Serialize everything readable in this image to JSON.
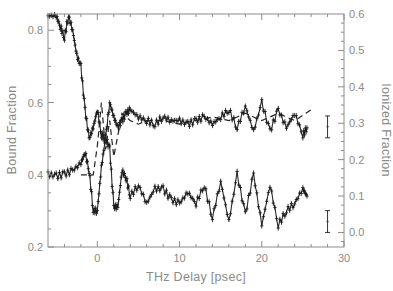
{
  "chart_data": {
    "type": "line",
    "title": "",
    "xlabel": "THz Delay [psec]",
    "ylabel_left": "Bound Fraction",
    "ylabel_right": "Ionized Fraction",
    "xlim": [
      -6,
      30
    ],
    "ylim_left": [
      0.2,
      0.845
    ],
    "ylim_right": [
      -0.04,
      0.6
    ],
    "x_ticks": [
      0,
      10,
      20,
      30
    ],
    "x_tick_labels": [
      "0",
      "10",
      "20",
      "30"
    ],
    "y_left_ticks": [
      0.2,
      0.4,
      0.6,
      0.8
    ],
    "y_left_tick_labels": [
      "0.2",
      "0.4",
      "0.6",
      "0.8"
    ],
    "y_right_ticks": [
      0.0,
      0.1,
      0.2,
      0.3,
      0.4,
      0.5,
      0.6
    ],
    "y_right_tick_labels": [
      "0.0",
      "0.1",
      "0.2",
      "0.3",
      "0.4",
      "0.5",
      "0.6"
    ],
    "grid": false,
    "legend": null,
    "series": [
      {
        "name": "Bound Fraction (measured)",
        "axis": "left",
        "style": "markers-with-line",
        "x": [
          -6,
          -5,
          -4.5,
          -4,
          -3.5,
          -3,
          -2.5,
          -2,
          -1.5,
          -1,
          -0.5,
          0,
          0.5,
          1,
          1.5,
          2,
          2.5,
          3,
          3.5,
          4,
          5,
          6,
          7,
          8,
          9,
          10,
          11,
          12,
          13,
          14,
          15,
          16,
          17,
          18,
          19,
          20,
          21,
          22,
          23,
          24,
          25,
          25.5
        ],
        "y": [
          0.84,
          0.84,
          0.81,
          0.78,
          0.84,
          0.8,
          0.73,
          0.7,
          0.58,
          0.5,
          0.53,
          0.58,
          0.51,
          0.5,
          0.6,
          0.56,
          0.53,
          0.55,
          0.57,
          0.58,
          0.56,
          0.55,
          0.54,
          0.56,
          0.55,
          0.55,
          0.54,
          0.55,
          0.56,
          0.54,
          0.56,
          0.58,
          0.53,
          0.59,
          0.52,
          0.6,
          0.52,
          0.58,
          0.53,
          0.57,
          0.51,
          0.53
        ]
      },
      {
        "name": "Ionized Fraction (measured)",
        "axis": "right",
        "style": "markers-with-line",
        "x": [
          -6,
          -5,
          -4,
          -3,
          -2,
          -1.5,
          -1,
          -0.5,
          0,
          0.5,
          1,
          1.5,
          2,
          2.5,
          3,
          3.5,
          4,
          5,
          6,
          7,
          8,
          9,
          10,
          11,
          12,
          13,
          14,
          15,
          16,
          17,
          18,
          19,
          20,
          21,
          22,
          23,
          24,
          25,
          25.5
        ],
        "y": [
          0.16,
          0.155,
          0.16,
          0.17,
          0.19,
          0.22,
          0.17,
          0.06,
          0.06,
          0.18,
          0.26,
          0.23,
          0.07,
          0.07,
          0.17,
          0.15,
          0.1,
          0.13,
          0.08,
          0.12,
          0.12,
          0.09,
          0.08,
          0.11,
          0.08,
          0.13,
          0.04,
          0.14,
          0.03,
          0.16,
          0.05,
          0.16,
          0.02,
          0.13,
          0.02,
          0.06,
          0.08,
          0.12,
          0.1
        ]
      },
      {
        "name": "Bound Fraction (theory, dashed)",
        "axis": "left",
        "style": "dashed",
        "x": [
          -2,
          -1,
          -0.5,
          0,
          0.5,
          1,
          1.5,
          2,
          3,
          4,
          5,
          6,
          8,
          10,
          12,
          14,
          16,
          18,
          20,
          22,
          24,
          26
        ],
        "y": [
          0.4,
          0.4,
          0.4,
          0.48,
          0.6,
          0.47,
          0.55,
          0.45,
          0.57,
          0.55,
          0.54,
          0.55,
          0.55,
          0.54,
          0.55,
          0.56,
          0.55,
          0.57,
          0.55,
          0.57,
          0.55,
          0.58
        ]
      }
    ],
    "annotations": [
      {
        "type": "error-bar",
        "axis": "right",
        "x": 28,
        "y": 0.29,
        "halfwidth": 0.03
      },
      {
        "type": "error-bar",
        "axis": "right",
        "x": 28,
        "y": 0.03,
        "halfwidth": 0.03
      }
    ]
  }
}
